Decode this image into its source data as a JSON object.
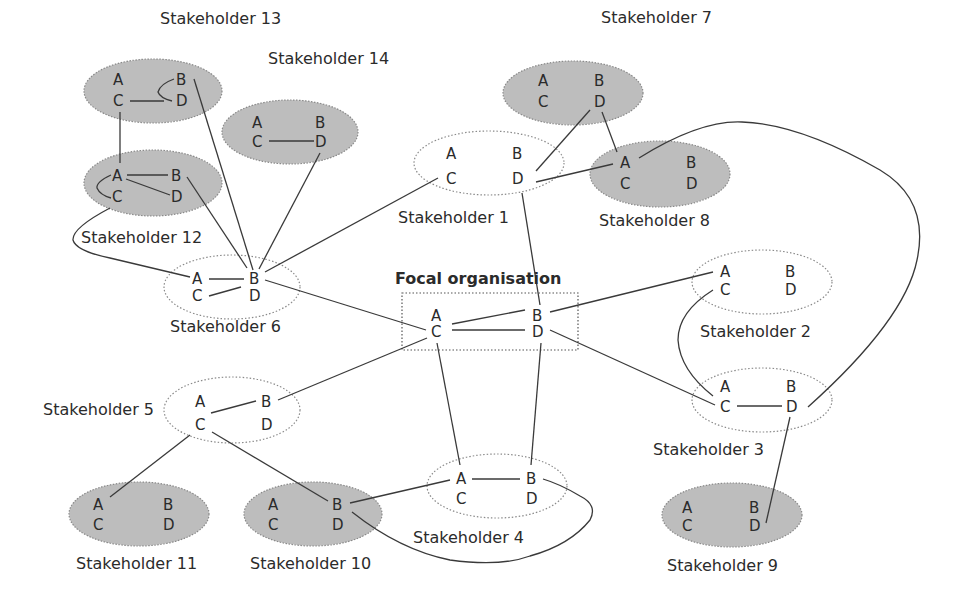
{
  "diagram": {
    "focal": {
      "label": "Focal organisation",
      "letters": [
        "A",
        "B",
        "C",
        "D"
      ]
    },
    "stakeholders": [
      {
        "id": 1,
        "label": "Stakeholder 1",
        "style": "outlined",
        "letters": [
          "A",
          "B",
          "C",
          "D"
        ]
      },
      {
        "id": 2,
        "label": "Stakeholder 2",
        "style": "outlined",
        "letters": [
          "A",
          "B",
          "C",
          "D"
        ]
      },
      {
        "id": 3,
        "label": "Stakeholder 3",
        "style": "outlined",
        "letters": [
          "A",
          "B",
          "C",
          "D"
        ]
      },
      {
        "id": 4,
        "label": "Stakeholder 4",
        "style": "outlined",
        "letters": [
          "A",
          "B",
          "C",
          "D"
        ]
      },
      {
        "id": 5,
        "label": "Stakeholder 5",
        "style": "outlined",
        "letters": [
          "A",
          "B",
          "C",
          "D"
        ]
      },
      {
        "id": 6,
        "label": "Stakeholder 6",
        "style": "outlined",
        "letters": [
          "A",
          "B",
          "C",
          "D"
        ]
      },
      {
        "id": 7,
        "label": "Stakeholder 7",
        "style": "shaded",
        "letters": [
          "A",
          "B",
          "C",
          "D"
        ]
      },
      {
        "id": 8,
        "label": "Stakeholder 8",
        "style": "shaded",
        "letters": [
          "A",
          "B",
          "C",
          "D"
        ]
      },
      {
        "id": 9,
        "label": "Stakeholder 9",
        "style": "shaded",
        "letters": [
          "A",
          "B",
          "C",
          "D"
        ]
      },
      {
        "id": 10,
        "label": "Stakeholder 10",
        "style": "shaded",
        "letters": [
          "A",
          "B",
          "C",
          "D"
        ]
      },
      {
        "id": 11,
        "label": "Stakeholder 11",
        "style": "shaded",
        "letters": [
          "A",
          "B",
          "C",
          "D"
        ]
      },
      {
        "id": 12,
        "label": "Stakeholder 12",
        "style": "shaded",
        "letters": [
          "A",
          "B",
          "C",
          "D"
        ]
      },
      {
        "id": 13,
        "label": "Stakeholder 13",
        "style": "shaded",
        "letters": [
          "A",
          "B",
          "C",
          "D"
        ]
      },
      {
        "id": 14,
        "label": "Stakeholder 14",
        "style": "shaded",
        "letters": [
          "A",
          "B",
          "C",
          "D"
        ]
      }
    ],
    "edges": [
      [
        "S13.C",
        "S13.D"
      ],
      [
        "S13.B",
        "S13.D"
      ],
      [
        "S13.C",
        "S12.A"
      ],
      [
        "S13.B",
        "S6.B"
      ],
      [
        "S14.C",
        "S14.D"
      ],
      [
        "S14.D",
        "S6.B"
      ],
      [
        "S12.A",
        "S12.B"
      ],
      [
        "S12.A",
        "S12.D"
      ],
      [
        "S12.A",
        "S12.C"
      ],
      [
        "S12.B",
        "S6.B"
      ],
      [
        "S12.C",
        "S6.A"
      ],
      [
        "S6.A",
        "S6.B"
      ],
      [
        "S6.C",
        "S6.D"
      ],
      [
        "S6.B",
        "S1.C"
      ],
      [
        "S6.B",
        "Focal.C"
      ],
      [
        "S1.D",
        "S7.D"
      ],
      [
        "S1.D",
        "S8.A"
      ],
      [
        "S1.D",
        "Focal.B"
      ],
      [
        "S7.D",
        "S8.A"
      ],
      [
        "S8.A",
        "S3.D"
      ],
      [
        "Focal.C",
        "Focal.B"
      ],
      [
        "Focal.C",
        "Focal.D"
      ],
      [
        "Focal.B",
        "S2.A"
      ],
      [
        "Focal.D",
        "S3.C"
      ],
      [
        "Focal.C",
        "S5.B"
      ],
      [
        "Focal.C",
        "S4.A"
      ],
      [
        "Focal.D",
        "S4.B"
      ],
      [
        "S2.C",
        "S3.C"
      ],
      [
        "S3.C",
        "S3.D"
      ],
      [
        "S3.D",
        "S9.D"
      ],
      [
        "S5.A",
        "S5.B"
      ],
      [
        "S5.C",
        "S11.A"
      ],
      [
        "S5.C",
        "S10.B"
      ],
      [
        "S10.B",
        "S4.A"
      ],
      [
        "S10.B",
        "S4.B"
      ],
      [
        "S4.A",
        "S4.B"
      ]
    ],
    "colors": {
      "shaded_fill": "#bdbdbd",
      "line": "#3a3a3a",
      "text": "#2b2b2b"
    }
  }
}
